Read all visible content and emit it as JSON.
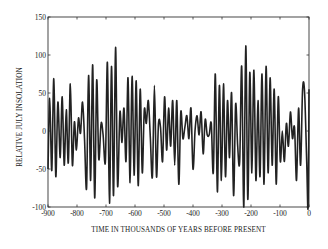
{
  "chart_data": {
    "type": "line",
    "title": "",
    "xlabel": "TIME IN THOUSANDS OF YEARS BEFORE PRESENT",
    "ylabel": "RELATIVE JULY INSOLATION",
    "xlim": [
      -900,
      0
    ],
    "ylim": [
      -100,
      150
    ],
    "x_ticks": [
      -900,
      -800,
      -700,
      -600,
      -500,
      -400,
      -300,
      -200,
      -100,
      0
    ],
    "y_ticks": [
      -100,
      -50,
      0,
      50,
      100,
      150
    ],
    "x_tick_labels": [
      "-900",
      "-800",
      "-700",
      "-600",
      "-500",
      "-400",
      "-300",
      "-200",
      "-100",
      "0"
    ],
    "y_tick_labels": [
      "-100",
      "-50",
      "0",
      "50",
      "100",
      "150"
    ],
    "grid": false,
    "legend": null,
    "series": [
      {
        "name": "Relative July insolation",
        "color": "#222222",
        "x": [
          -900,
          -894,
          -887,
          -880,
          -873,
          -866,
          -858,
          -851,
          -844,
          -837,
          -830,
          -823,
          -816,
          -809,
          -802,
          -795,
          -788,
          -781,
          -774,
          -767,
          -760,
          -753,
          -746,
          -739,
          -732,
          -725,
          -717,
          -710,
          -702,
          -695,
          -688,
          -681,
          -674,
          -667,
          -660,
          -652,
          -645,
          -638,
          -631,
          -624,
          -617,
          -610,
          -603,
          -596,
          -589,
          -582,
          -575,
          -568,
          -561,
          -554,
          -547,
          -540,
          -533,
          -526,
          -519,
          -512,
          -505,
          -498,
          -491,
          -484,
          -477,
          -470,
          -463,
          -456,
          -449,
          -442,
          -435,
          -428,
          -421,
          -414,
          -407,
          -400,
          -393,
          -386,
          -379,
          -372,
          -365,
          -358,
          -351,
          -344,
          -337,
          -330,
          -323,
          -316,
          -309,
          -302,
          -295,
          -288,
          -281,
          -274,
          -267,
          -260,
          -253,
          -246,
          -239,
          -232,
          -225,
          -218,
          -211,
          -204,
          -197,
          -190,
          -183,
          -176,
          -169,
          -162,
          -155,
          -148,
          -141,
          -134,
          -127,
          -120,
          -113,
          -106,
          -99,
          -92,
          -85,
          -78,
          -71,
          -64,
          -57,
          -50,
          -43,
          -36,
          -29,
          -22,
          -15,
          -8,
          -3,
          0
        ],
        "y": [
          -50,
          43,
          -52,
          69,
          -60,
          38,
          -35,
          45,
          -45,
          28,
          -42,
          62,
          -45,
          12,
          -25,
          17,
          -3,
          38,
          -10,
          -75,
          73,
          -65,
          87,
          -88,
          67,
          -37,
          10,
          -5,
          -40,
          90,
          -95,
          85,
          -85,
          110,
          -72,
          25,
          -15,
          30,
          -40,
          70,
          -68,
          72,
          -58,
          66,
          -72,
          55,
          -55,
          28,
          10,
          40,
          -10,
          -60,
          60,
          -60,
          10,
          5,
          -40,
          45,
          -25,
          30,
          -20,
          40,
          -45,
          40,
          -70,
          25,
          -10,
          5,
          20,
          -10,
          30,
          -50,
          0,
          20,
          -5,
          25,
          -30,
          15,
          -5,
          -5,
          10,
          -55,
          75,
          -80,
          60,
          -65,
          62,
          -60,
          40,
          -35,
          50,
          -85,
          35,
          -20,
          -40,
          85,
          -100,
          112,
          -90,
          77,
          -55,
          80,
          -65,
          40,
          -60,
          75,
          -70,
          85,
          -55,
          70,
          -45,
          55,
          -70,
          45,
          -40,
          0,
          -40,
          10,
          -20,
          25,
          -10,
          5,
          -65,
          30,
          -45,
          55,
          50,
          -40,
          -100,
          55
        ]
      }
    ]
  },
  "plot_area": {
    "left": 48,
    "top": 17,
    "right": 309,
    "bottom": 207
  }
}
